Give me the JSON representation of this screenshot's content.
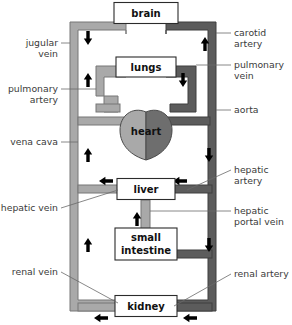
{
  "figure": {
    "background_color": "#ffffff"
  },
  "colors": {
    "vein_fill": "#a9a9a9",
    "artery_fill": "#5c5c5c",
    "vessel_outline": "#777777",
    "artery_outline": "#3f3f3f",
    "heart_left_fill": "#a9a9a9",
    "heart_right_fill": "#6e6e6e",
    "heart_outline": "#4a4a4a",
    "arrow_color": "#000000",
    "organ_box_fill": "#ffffff",
    "organ_box_stroke": "#2b2b2b",
    "label_color": "#3a3a3a",
    "organ_text_color": "#111111",
    "leader_color": "#6a6a6a"
  },
  "organs": [
    {
      "id": "brain",
      "label": "brain",
      "x": 146,
      "y": 13,
      "w": 64,
      "h": 21
    },
    {
      "id": "lungs",
      "label": "lungs",
      "x": 146,
      "y": 67,
      "w": 60,
      "h": 20
    },
    {
      "id": "heart",
      "label": "heart",
      "x": 146,
      "y": 130,
      "w": 50,
      "h": 48
    },
    {
      "id": "liver",
      "label": "liver",
      "x": 146,
      "y": 189,
      "w": 58,
      "h": 21
    },
    {
      "id": "small-intestine",
      "label": "small intestine",
      "x": 146,
      "y": 244,
      "w": 62,
      "h": 32
    },
    {
      "id": "kidney",
      "label": "kidney",
      "x": 146,
      "y": 306,
      "w": 62,
      "h": 21
    }
  ],
  "callouts": [
    {
      "id": "jugular-vein",
      "label": "jugular vein",
      "side": "left",
      "lines": [
        "jugular",
        "vein"
      ],
      "text_x": 58,
      "text_y": 46
    },
    {
      "id": "pulmonary-artery",
      "label": "pulmonary artery",
      "side": "left",
      "lines": [
        "pulmonary",
        "artery"
      ],
      "text_x": 58,
      "text_y": 92
    },
    {
      "id": "vena-cava",
      "label": "vena cava",
      "side": "left",
      "lines": [
        "vena cava"
      ],
      "text_x": 58,
      "text_y": 145
    },
    {
      "id": "hepatic-vein",
      "label": "hepatic vein",
      "side": "left",
      "lines": [
        "hepatic vein"
      ],
      "text_x": 58,
      "text_y": 211
    },
    {
      "id": "renal-vein",
      "label": "renal vein",
      "side": "left",
      "lines": [
        "renal vein"
      ],
      "text_x": 58,
      "text_y": 275
    },
    {
      "id": "carotid-artery",
      "label": "carotid artery",
      "side": "right",
      "lines": [
        "carotid",
        "artery"
      ],
      "text_x": 234,
      "text_y": 36
    },
    {
      "id": "pulmonary-vein",
      "label": "pulmonary vein",
      "side": "right",
      "lines": [
        "pulmonary",
        "vein"
      ],
      "text_x": 234,
      "text_y": 68
    },
    {
      "id": "aorta",
      "label": "aorta",
      "side": "right",
      "lines": [
        "aorta"
      ],
      "text_x": 234,
      "text_y": 113
    },
    {
      "id": "hepatic-artery",
      "label": "hepatic artery",
      "side": "right",
      "lines": [
        "hepatic",
        "artery"
      ],
      "text_x": 234,
      "text_y": 173
    },
    {
      "id": "hepatic-portal-vein",
      "label": "hepatic portal vein",
      "side": "right",
      "lines": [
        "hepatic",
        "portal vein"
      ],
      "text_x": 234,
      "text_y": 214
    },
    {
      "id": "renal-artery",
      "label": "renal artery",
      "side": "right",
      "lines": [
        "renal artery"
      ],
      "text_x": 234,
      "text_y": 277
    }
  ],
  "flow_arrows": [
    {
      "id": "jugular-down",
      "direction": "down",
      "x": 88,
      "y": 38
    },
    {
      "id": "carotid-up",
      "direction": "up",
      "x": 205,
      "y": 44
    },
    {
      "id": "pulmonary-artery-up",
      "direction": "up",
      "x": 88,
      "y": 80
    },
    {
      "id": "pulmonary-vein-down",
      "direction": "down",
      "x": 183,
      "y": 80
    },
    {
      "id": "vena-cava-up",
      "direction": "up",
      "x": 88,
      "y": 155
    },
    {
      "id": "aorta-down",
      "direction": "down",
      "x": 209,
      "y": 155
    },
    {
      "id": "hepatic-vein-left",
      "direction": "left",
      "x": 106,
      "y": 181
    },
    {
      "id": "hepatic-artery-left",
      "direction": "left",
      "x": 180,
      "y": 181
    },
    {
      "id": "portal-vein-up",
      "direction": "up",
      "x": 137,
      "y": 219
    },
    {
      "id": "aorta-lower-down",
      "direction": "down",
      "x": 209,
      "y": 245
    },
    {
      "id": "vena-cava-lower-up",
      "direction": "up",
      "x": 88,
      "y": 245
    },
    {
      "id": "renal-vein-left",
      "direction": "left",
      "x": 101,
      "y": 318
    },
    {
      "id": "renal-artery-left",
      "direction": "left",
      "x": 190,
      "y": 318
    }
  ]
}
